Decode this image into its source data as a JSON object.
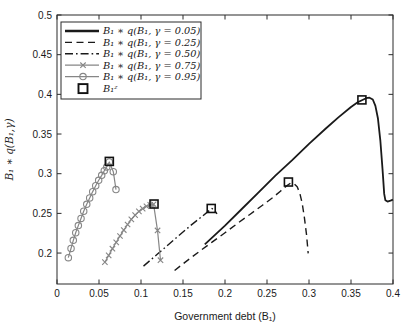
{
  "figure": {
    "background": "#ffffff",
    "axis_color": "#2b2b2b",
    "text_color": "#1a1a1a",
    "black_line_color": "#1a1a1a",
    "gray_line_color": "#868686"
  },
  "chart_data": {
    "type": "line",
    "title": "",
    "xlabel": "Government debt (B₁)",
    "ylabel": "B₁ ∗ q(B₁,γ)",
    "xlim": [
      0,
      0.4
    ],
    "ylim": [
      0.161,
      0.5
    ],
    "x_ticks": [
      0,
      0.05,
      0.1,
      0.15,
      0.2,
      0.25,
      0.3,
      0.35,
      0.4
    ],
    "x_tick_labels": [
      "0",
      "0.05",
      "0.1",
      "0.15",
      "0.2",
      "0.25",
      "0.3",
      "0.35",
      "0.4"
    ],
    "y_ticks": [
      0.2,
      0.25,
      0.3,
      0.35,
      0.4,
      0.45,
      0.5
    ],
    "y_tick_labels": [
      "0.2",
      "0.25",
      "0.3",
      "0.35",
      "0.4",
      "0.45",
      "0.5"
    ],
    "grid": false,
    "legend_position": "top-left",
    "series": [
      {
        "name": "B₁ ∗ q(B₁, γ = 0.05)",
        "style": "solid",
        "color": "#1a1a1a",
        "width": 1.8,
        "marker": "none",
        "points": [
          [
            0.176,
            0.211
          ],
          [
            0.2,
            0.2345
          ],
          [
            0.22,
            0.2555
          ],
          [
            0.24,
            0.2765
          ],
          [
            0.26,
            0.2975
          ],
          [
            0.28,
            0.317
          ],
          [
            0.3,
            0.3375
          ],
          [
            0.32,
            0.357
          ],
          [
            0.335,
            0.371
          ],
          [
            0.35,
            0.384
          ],
          [
            0.358,
            0.39
          ],
          [
            0.363,
            0.3925
          ],
          [
            0.368,
            0.3952
          ],
          [
            0.372,
            0.3958
          ],
          [
            0.376,
            0.3935
          ],
          [
            0.379,
            0.3855
          ],
          [
            0.382,
            0.37
          ],
          [
            0.385,
            0.341
          ],
          [
            0.3875,
            0.306
          ],
          [
            0.3895,
            0.2745
          ],
          [
            0.391,
            0.2665
          ],
          [
            0.3935,
            0.2648
          ],
          [
            0.397,
            0.266
          ],
          [
            0.4,
            0.2672
          ]
        ]
      },
      {
        "name": "B₁ ∗ q(B₁, γ = 0.25)",
        "style": "dashed",
        "color": "#1a1a1a",
        "width": 1.4,
        "marker": "none",
        "points": [
          [
            0.14,
            0.178
          ],
          [
            0.155,
            0.1905
          ],
          [
            0.17,
            0.2025
          ],
          [
            0.185,
            0.214
          ],
          [
            0.2,
            0.2255
          ],
          [
            0.215,
            0.2375
          ],
          [
            0.23,
            0.249
          ],
          [
            0.245,
            0.2605
          ],
          [
            0.257,
            0.27
          ],
          [
            0.266,
            0.278
          ],
          [
            0.2725,
            0.284
          ],
          [
            0.278,
            0.288
          ],
          [
            0.282,
            0.2875
          ],
          [
            0.286,
            0.2835
          ],
          [
            0.289,
            0.2755
          ],
          [
            0.292,
            0.262
          ],
          [
            0.2945,
            0.2445
          ],
          [
            0.297,
            0.2235
          ],
          [
            0.299,
            0.1996
          ]
        ]
      },
      {
        "name": "B₁ ∗ q(B₁, γ = 0.50)",
        "style": "dashdot",
        "color": "#1a1a1a",
        "width": 1.4,
        "marker": "none",
        "points": [
          [
            0.103,
            0.1835
          ],
          [
            0.12,
            0.199
          ],
          [
            0.14,
            0.2175
          ],
          [
            0.16,
            0.2355
          ],
          [
            0.172,
            0.2455
          ],
          [
            0.18,
            0.2525
          ],
          [
            0.1845,
            0.2562
          ],
          [
            0.188,
            0.2535
          ],
          [
            0.1905,
            0.2495
          ]
        ]
      },
      {
        "name": "B₁ ∗ q(B₁, γ = 0.75)",
        "style": "solid",
        "color": "#868686",
        "width": 1.2,
        "marker": "x",
        "points": [
          [
            0.057,
            0.1885
          ],
          [
            0.0615,
            0.197
          ],
          [
            0.066,
            0.2055
          ],
          [
            0.0705,
            0.2135
          ],
          [
            0.075,
            0.2215
          ],
          [
            0.0795,
            0.229
          ],
          [
            0.084,
            0.236
          ],
          [
            0.0885,
            0.2425
          ],
          [
            0.093,
            0.2478
          ],
          [
            0.0975,
            0.2525
          ],
          [
            0.102,
            0.256
          ],
          [
            0.1065,
            0.259
          ],
          [
            0.111,
            0.2608
          ],
          [
            0.115,
            0.2615
          ],
          [
            0.1197,
            0.2285
          ],
          [
            0.1232,
            0.191
          ]
        ]
      },
      {
        "name": "B₁ ∗ q(B₁, γ = 0.95)",
        "style": "solid",
        "color": "#868686",
        "width": 1.2,
        "marker": "o",
        "points": [
          [
            0.0135,
            0.1942
          ],
          [
            0.0167,
            0.2058
          ],
          [
            0.0194,
            0.216
          ],
          [
            0.0223,
            0.2256
          ],
          [
            0.0254,
            0.2346
          ],
          [
            0.0286,
            0.2436
          ],
          [
            0.0318,
            0.2527
          ],
          [
            0.0354,
            0.2614
          ],
          [
            0.0389,
            0.2695
          ],
          [
            0.0425,
            0.2774
          ],
          [
            0.0461,
            0.2848
          ],
          [
            0.0496,
            0.2917
          ],
          [
            0.0532,
            0.2979
          ],
          [
            0.0563,
            0.3037
          ],
          [
            0.0592,
            0.3086
          ],
          [
            0.0623,
            0.3148
          ],
          [
            0.067,
            0.3025
          ],
          [
            0.0702,
            0.28
          ]
        ]
      },
      {
        "name": "B₁ᶻ",
        "style": "none",
        "color": "#111111",
        "width": 1.6,
        "marker": "square",
        "points": [
          [
            0.0623,
            0.3155
          ],
          [
            0.1155,
            0.2618
          ],
          [
            0.1836,
            0.2562
          ],
          [
            0.2755,
            0.2895
          ],
          [
            0.363,
            0.393
          ]
        ]
      }
    ]
  }
}
